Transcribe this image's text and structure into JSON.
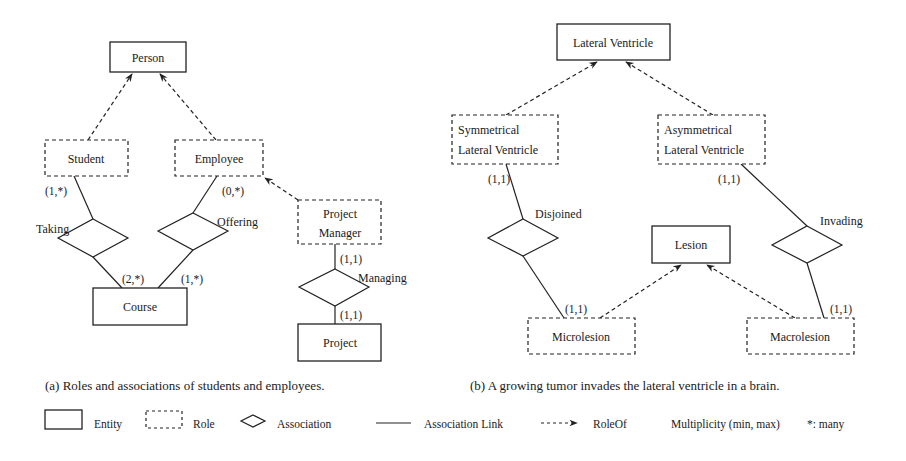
{
  "figure_a": {
    "caption": "(a) Roles and associations of students and employees.",
    "entities": {
      "person": "Person",
      "course": "Course",
      "project": "Project"
    },
    "roles": {
      "student": "Student",
      "employee": "Employee",
      "project_manager_line1": "Project",
      "project_manager_line2": "Manager"
    },
    "associations": {
      "taking": "Taking",
      "offering": "Offering",
      "managing": "Managing"
    },
    "multiplicities": {
      "student_taking": "(1,*)",
      "employee_offering": "(0,*)",
      "taking_course": "(2,*)",
      "offering_course": "(1,*)",
      "pm_managing": "(1,1)",
      "managing_project": "(1,1)"
    }
  },
  "figure_b": {
    "caption": "(b) A growing tumor invades the lateral ventricle in a brain.",
    "entities": {
      "lateral_ventricle": "Lateral Ventricle",
      "lesion": "Lesion"
    },
    "roles": {
      "symmetrical_line1": "Symmetrical",
      "symmetrical_line2": "Lateral Ventricle",
      "asymmetrical_line1": "Asymmetrical",
      "asymmetrical_line2": "Lateral Ventricle",
      "microlesion": "Microlesion",
      "macrolesion": "Macrolesion"
    },
    "associations": {
      "disjoined": "Disjoined",
      "invading": "Invading"
    },
    "multiplicities": {
      "sym_disjoined": "(1,1)",
      "asym_invading": "(1,1)",
      "disjoined_micro": "(1,1)",
      "invading_macro": "(1,1)"
    }
  },
  "legend": {
    "entity": "Entity",
    "role": "Role",
    "association": "Association",
    "association_link": "Association Link",
    "role_of": "RoleOf",
    "multiplicity": "Multiplicity (min, max)",
    "many": "*: many"
  }
}
